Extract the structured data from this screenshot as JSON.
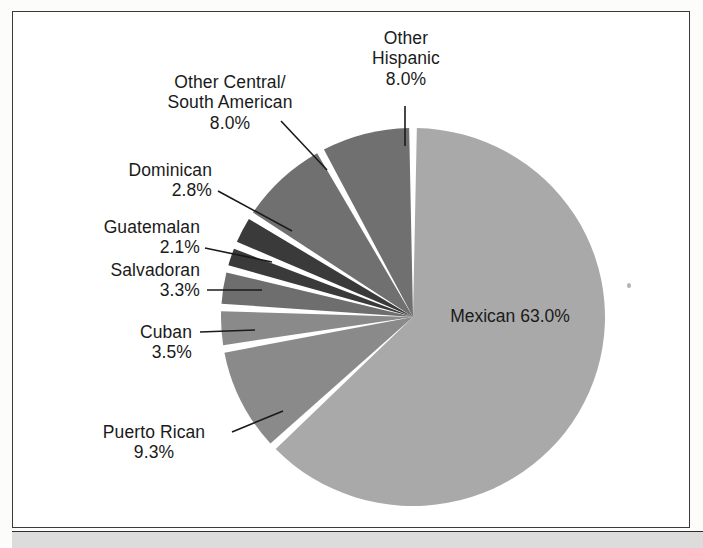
{
  "figure": {
    "background_color": "#ffffff",
    "frame_color": "#3a3a3a",
    "bottom_band_color": "#dcdcdc",
    "separator_color": "#ffffff",
    "label_color": "#1a1a1a"
  },
  "chart_data": {
    "type": "pie",
    "title": "",
    "subtitle": "",
    "xlabel": "",
    "ylabel": "",
    "legend_position": "none",
    "grid": false,
    "units": "percent",
    "start_angle_deg": 0,
    "direction": "clockwise",
    "total": 100.0,
    "categories": [
      "Mexican",
      "Puerto Rican",
      "Cuban",
      "Salvadoran",
      "Guatemalan",
      "Dominican",
      "Other Central/South American",
      "Other Hispanic"
    ],
    "values": [
      63.0,
      9.3,
      3.5,
      3.3,
      2.1,
      2.8,
      8.0,
      8.0
    ],
    "value_labels": [
      "63.0%",
      "9.3%",
      "3.5%",
      "3.3%",
      "2.1%",
      "2.8%",
      "8.0%",
      "8.0%"
    ],
    "colors": [
      "#a9a9a9",
      "#8a8a8a",
      "#8a8a8a",
      "#6e6e6e",
      "#3a3a3a",
      "#3a3a3a",
      "#707070",
      "#707070"
    ],
    "slices": [
      {
        "name": "Mexican",
        "value": 63.0,
        "value_label": "63.0%",
        "color": "#a9a9a9",
        "label_placement": "inside",
        "label_line1": "Mexican",
        "label_line2": "63.0%"
      },
      {
        "name": "Puerto Rican",
        "value": 9.3,
        "value_label": "9.3%",
        "color": "#8a8a8a",
        "label_placement": "outside-left",
        "label_line1": "Puerto Rican",
        "label_line2": "9.3%"
      },
      {
        "name": "Cuban",
        "value": 3.5,
        "value_label": "3.5%",
        "color": "#8a8a8a",
        "label_placement": "outside-left",
        "label_line1": "Cuban",
        "label_line2": "3.5%"
      },
      {
        "name": "Salvadoran",
        "value": 3.3,
        "value_label": "3.3%",
        "color": "#6e6e6e",
        "label_placement": "outside-left",
        "label_line1": "Salvadoran",
        "label_line2": "3.3%"
      },
      {
        "name": "Guatemalan",
        "value": 2.1,
        "value_label": "2.1%",
        "color": "#3a3a3a",
        "label_placement": "outside-left",
        "label_line1": "Guatemalan",
        "label_line2": "2.1%"
      },
      {
        "name": "Dominican",
        "value": 2.8,
        "value_label": "2.8%",
        "color": "#3a3a3a",
        "label_placement": "outside-left",
        "label_line1": "Dominican",
        "label_line2": "2.8%"
      },
      {
        "name": "Other Central/South American",
        "value": 8.0,
        "value_label": "8.0%",
        "color": "#707070",
        "label_placement": "outside-top-left",
        "label_line1": "Other Central/",
        "label_line2": "South American",
        "label_line3": "8.0%"
      },
      {
        "name": "Other Hispanic",
        "value": 8.0,
        "value_label": "8.0%",
        "color": "#707070",
        "label_placement": "outside-top",
        "label_line1": "Other",
        "label_line2": "Hispanic",
        "label_line3": "8.0%"
      }
    ]
  }
}
